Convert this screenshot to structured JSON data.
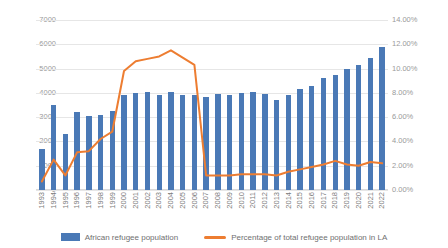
{
  "chart_data": {
    "type": "bar",
    "title": "",
    "xlabel": "",
    "ylabel": "",
    "ylim": [
      0,
      7000
    ],
    "y2lim": [
      0,
      14
    ],
    "grid": true,
    "legend_position": "bottom",
    "categories": [
      "1993",
      "1994",
      "1995",
      "1996",
      "1997",
      "1998",
      "1999",
      "2000",
      "2001",
      "2002",
      "2003",
      "2004",
      "2005",
      "2006",
      "2007",
      "2008",
      "2009",
      "2010",
      "2011",
      "2012",
      "2013",
      "2014",
      "2015",
      "2016",
      "2017",
      "2018",
      "2019",
      "2020",
      "2021",
      "2022"
    ],
    "y_ticks": [
      "0",
      "1000",
      "2000",
      "3000",
      "4000",
      "5000",
      "6000",
      "7000"
    ],
    "y2_ticks": [
      "0.00%",
      "2.00%",
      "4.00%",
      "6.00%",
      "8.00%",
      "10.00%",
      "12.00%",
      "14.00%"
    ],
    "series": [
      {
        "name": "African refugee population",
        "type": "bar",
        "axis": "left",
        "color": "#4a79b6",
        "values": [
          1700,
          3500,
          2300,
          3200,
          3050,
          3100,
          3250,
          3900,
          4000,
          4050,
          3900,
          4050,
          3900,
          3900,
          3850,
          3950,
          3900,
          4000,
          4050,
          3950,
          3700,
          3900,
          4150,
          4300,
          4600,
          4750,
          5000,
          5150,
          5450,
          5900
        ]
      },
      {
        "name": "Percentage of total refugee population in LA",
        "type": "line",
        "axis": "right",
        "color": "#ed7d31",
        "values": [
          0.7,
          2.5,
          1.2,
          3.1,
          3.2,
          4.2,
          4.8,
          9.8,
          10.6,
          10.8,
          11.0,
          11.5,
          10.9,
          10.3,
          1.2,
          1.2,
          1.2,
          1.3,
          1.3,
          1.3,
          1.2,
          1.5,
          1.7,
          1.9,
          2.1,
          2.4,
          2.1,
          2.0,
          2.3,
          2.2
        ]
      }
    ]
  },
  "legend": {
    "bar_label": "African refugee population",
    "line_label": "Percentage of total refugee population in LA"
  }
}
